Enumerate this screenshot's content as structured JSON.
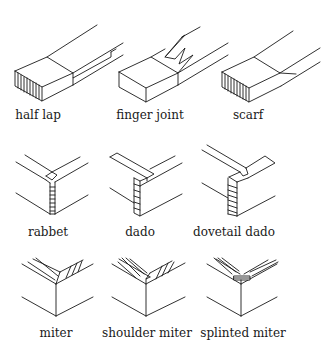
{
  "diagram": {
    "rows": [
      {
        "joints": [
          {
            "id": "half-lap",
            "label": "half lap",
            "x": 38,
            "y": 108
          },
          {
            "id": "finger-joint",
            "label": "finger joint",
            "x": 150,
            "y": 108
          },
          {
            "id": "scarf",
            "label": "scarf",
            "x": 248,
            "y": 108
          }
        ]
      },
      {
        "joints": [
          {
            "id": "rabbet",
            "label": "rabbet",
            "x": 48,
            "y": 225
          },
          {
            "id": "dado",
            "label": "dado",
            "x": 140,
            "y": 225
          },
          {
            "id": "dovetail-dado",
            "label": "dovetail dado",
            "x": 234,
            "y": 225
          }
        ]
      },
      {
        "joints": [
          {
            "id": "miter",
            "label": "miter",
            "x": 56,
            "y": 326
          },
          {
            "id": "shoulder-miter",
            "label": "shoulder miter",
            "x": 147,
            "y": 326
          },
          {
            "id": "splinted-miter",
            "label": "splinted miter",
            "x": 243,
            "y": 326
          }
        ]
      }
    ],
    "colors": {
      "ink": "#1a1a1a",
      "background": "#ffffff"
    }
  }
}
